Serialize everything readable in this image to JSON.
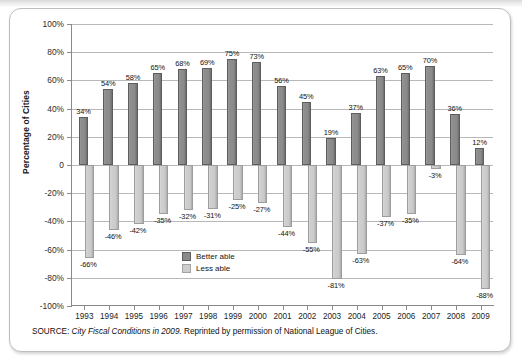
{
  "figure": {
    "source_prefix": "SOURCE:",
    "source_title": "City Fiscal Conditions in 2009.",
    "source_rest": "Reprinted by permission of National League of Cities."
  },
  "chart_data": {
    "type": "bar",
    "title": "",
    "subtitle": "",
    "xlabel": "",
    "ylabel": "Percentage of Cities",
    "ylim": [
      -100,
      100
    ],
    "grid": true,
    "legend_position": "inside-center",
    "categories": [
      "1993",
      "1994",
      "1995",
      "1996",
      "1997",
      "1998",
      "1999",
      "2000",
      "2001",
      "2002",
      "2003",
      "2004",
      "2005",
      "2006",
      "2007",
      "2008",
      "2009"
    ],
    "ytick_labels": [
      "100%",
      "80%",
      "60%",
      "40%",
      "20%",
      "0",
      "-20%",
      "-40%",
      "-60%",
      "-80%",
      "-100%"
    ],
    "ytick_values": [
      100,
      80,
      60,
      40,
      20,
      0,
      -20,
      -40,
      -60,
      -80,
      -100
    ],
    "series": [
      {
        "name": "Better able",
        "color": "#8a8a8a",
        "values": [
          34,
          54,
          58,
          65,
          68,
          69,
          75,
          73,
          56,
          45,
          19,
          37,
          63,
          65,
          70,
          36,
          12
        ],
        "labels": [
          "34%",
          "54%",
          "58%",
          "65%",
          "68%",
          "69%",
          "75%",
          "73%",
          "56%",
          "45%",
          "19%",
          "37%",
          "63%",
          "65%",
          "70%",
          "36%",
          "12%"
        ]
      },
      {
        "name": "Less able",
        "color": "#cdcdcd",
        "values": [
          -66,
          -46,
          -42,
          -35,
          -32,
          -31,
          -25,
          -27,
          -44,
          -55,
          -81,
          -63,
          -37,
          -35,
          -3,
          -64,
          -88
        ],
        "labels": [
          "-66%",
          "-46%",
          "-42%",
          "-35%",
          "-32%",
          "-31%",
          "-25%",
          "-27%",
          "-44%",
          "-55%",
          "-81%",
          "-63%",
          "-37%",
          "-35%",
          "-3%",
          "-64%",
          "-88%"
        ]
      }
    ]
  }
}
